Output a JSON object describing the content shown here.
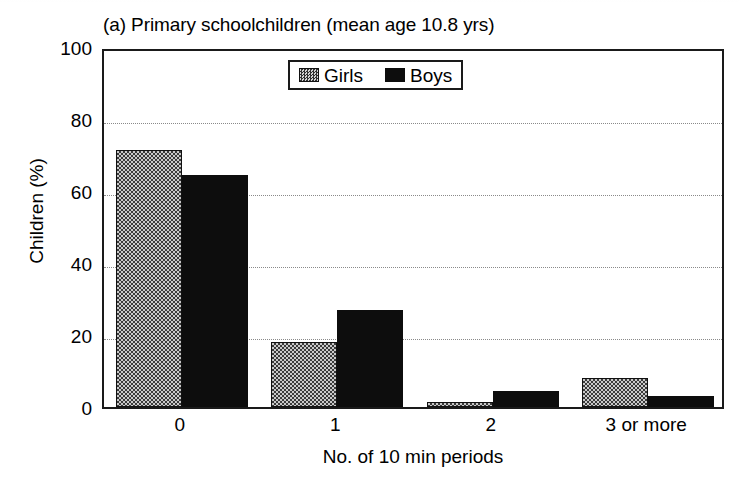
{
  "figure": {
    "panel_title": "(a) Primary schoolchildren (mean age 10.8 yrs)",
    "y_axis_title": "Children (%)",
    "x_axis_title": "No. of 10 min periods"
  },
  "legend": {
    "entries": [
      {
        "label": "Girls",
        "swatch": "checkered-gray-swatch",
        "color": "#6e6e6e"
      },
      {
        "label": "Boys",
        "swatch": "solid-black-swatch",
        "color": "#0d0d0d"
      }
    ]
  },
  "axes": {
    "y_ticks": [
      "100",
      "80",
      "60",
      "40",
      "20",
      "0"
    ],
    "x_ticks": [
      "0",
      "1",
      "2",
      "3 or more"
    ]
  },
  "chart_data": {
    "type": "bar",
    "title": "(a) Primary schoolchildren (mean age 10.8 yrs)",
    "xlabel": "No. of 10 min periods",
    "ylabel": "Children (%)",
    "categories": [
      "0",
      "1",
      "2",
      "3 or more"
    ],
    "series": [
      {
        "name": "Girls",
        "values": [
          71.5,
          18.0,
          1.5,
          8.0
        ],
        "color": "#6e6e6e",
        "fill": "checkered"
      },
      {
        "name": "Boys",
        "values": [
          64.5,
          27.0,
          4.5,
          3.0
        ],
        "color": "#0d0d0d",
        "fill": "solid"
      }
    ],
    "ylim": [
      0,
      100
    ],
    "ytick_step": 20,
    "grid": true,
    "grid_axis": "y",
    "grid_style": "dotted",
    "legend_position": "top-center",
    "bar_mode": "grouped"
  }
}
